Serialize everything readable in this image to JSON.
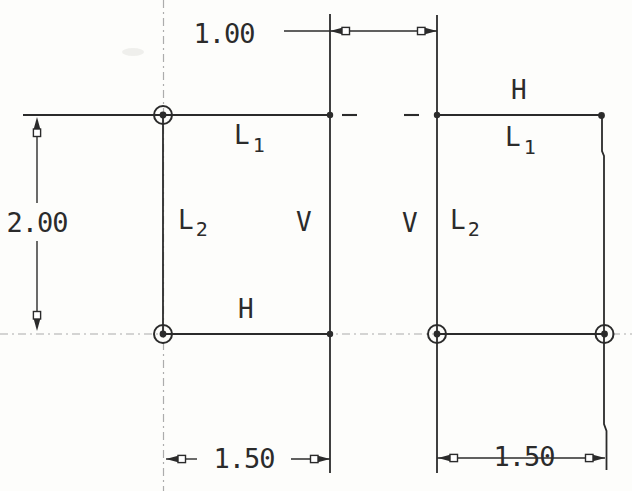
{
  "dimensions": {
    "gap_horizontal": "1.00",
    "left_height": "2.00",
    "left_width": "1.50",
    "right_width": "1.50"
  },
  "left_figure": {
    "line1_label": "L",
    "line1_sub": "1",
    "line2_label": "L",
    "line2_sub": "2",
    "vertical_constraint": "V",
    "horizontal_constraint": "H"
  },
  "right_figure": {
    "horizontal_constraint": "H",
    "line1_label": "L",
    "line1_sub": "1",
    "vertical_constraint": "V",
    "line2_label": "L",
    "line2_sub": "2"
  },
  "markers": {
    "fixed_point_icon": "circle-dot",
    "endpoint_icon": "dot"
  },
  "colors": {
    "line": "#2b2b2b",
    "centerline": "#acacac",
    "background": "#fdfdfb"
  }
}
